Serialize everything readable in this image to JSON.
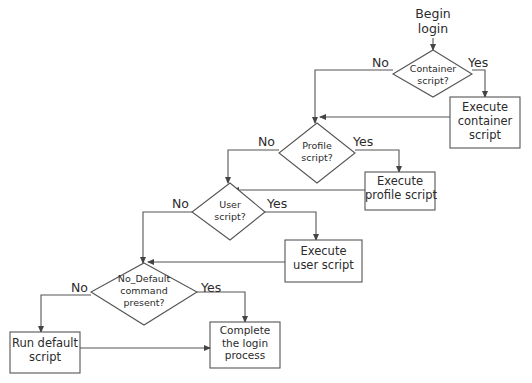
{
  "diagram": {
    "start": {
      "label_line1": "Begin",
      "label_line2": "login"
    },
    "decisions": [
      {
        "id": "container",
        "line1": "Container",
        "line2": "script?",
        "line3": ""
      },
      {
        "id": "profile",
        "line1": "Profile",
        "line2": "script?",
        "line3": ""
      },
      {
        "id": "user",
        "line1": "User",
        "line2": "script?",
        "line3": ""
      },
      {
        "id": "no-default",
        "line1": "No_Default",
        "line2": "command",
        "line3": "present?"
      }
    ],
    "processes": [
      {
        "id": "execute-container",
        "line1": "Execute",
        "line2": "container",
        "line3": "script"
      },
      {
        "id": "execute-profile",
        "line1": "Execute",
        "line2": "profile script",
        "line3": ""
      },
      {
        "id": "execute-user",
        "line1": "Execute",
        "line2": "user script",
        "line3": ""
      },
      {
        "id": "run-default",
        "line1": "Run default",
        "line2": "script",
        "line3": ""
      },
      {
        "id": "complete-login",
        "line1": "Complete",
        "line2": "the login",
        "line3": "process"
      }
    ],
    "branch_labels": {
      "yes": "Yes",
      "no": "No"
    },
    "colors": {
      "stroke": "#555555",
      "text": "#2b2b2b",
      "background": "#ffffff"
    }
  }
}
